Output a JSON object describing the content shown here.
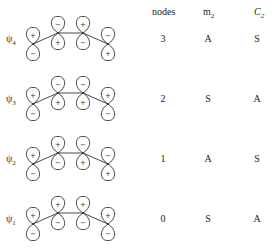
{
  "headers": {
    "nodes": "nodes",
    "m2": "m",
    "m2_sub": "2",
    "c2": "C",
    "c2_sub": "2"
  },
  "rows": [
    {
      "psi": "ψ",
      "psi_sub": "4",
      "nodes": "3",
      "m2": "A",
      "c2": "S",
      "signs": [
        [
          "+",
          "-"
        ],
        [
          "-",
          "+"
        ],
        [
          "+",
          "-"
        ],
        [
          "-",
          "+"
        ]
      ]
    },
    {
      "psi": "ψ",
      "psi_sub": "3",
      "nodes": "2",
      "m2": "S",
      "c2": "A",
      "signs": [
        [
          "+",
          "-"
        ],
        [
          "-",
          "+"
        ],
        [
          "-",
          "+"
        ],
        [
          "+",
          "-"
        ]
      ]
    },
    {
      "psi": "ψ",
      "psi_sub": "2",
      "nodes": "1",
      "m2": "A",
      "c2": "S",
      "signs": [
        [
          "+",
          "-"
        ],
        [
          "+",
          "-"
        ],
        [
          "-",
          "+"
        ],
        [
          "-",
          "+"
        ]
      ]
    },
    {
      "psi": "ψ",
      "psi_sub": "1",
      "nodes": "0",
      "m2": "S",
      "c2": "A",
      "signs": [
        [
          "+",
          "-"
        ],
        [
          "+",
          "-"
        ],
        [
          "+",
          "-"
        ],
        [
          "+",
          "-"
        ]
      ]
    }
  ],
  "colors": {
    "line": "#333333",
    "text": "#222222"
  }
}
